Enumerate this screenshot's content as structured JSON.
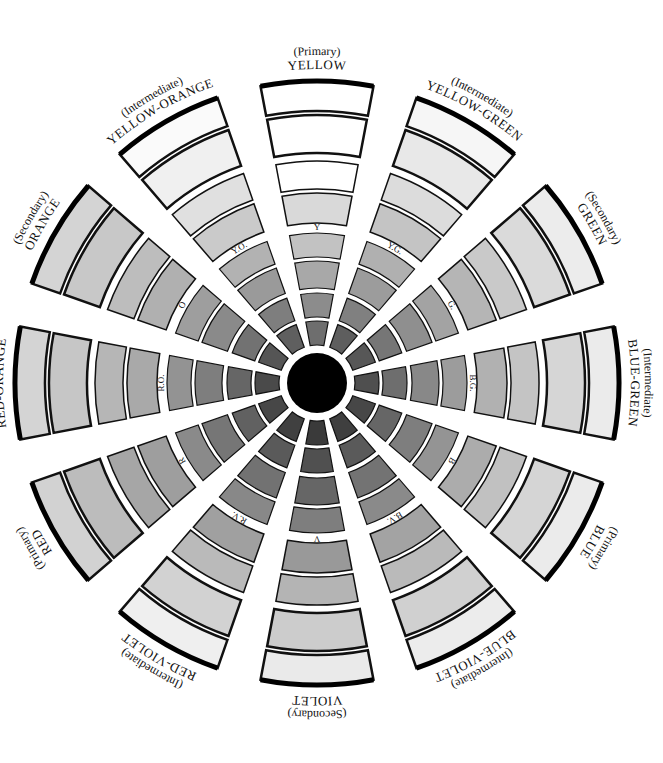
{
  "diagram": {
    "center": {
      "x": 317,
      "y": 383,
      "radius": 30,
      "color": "#000000"
    },
    "sector_span_deg": 22,
    "rings": [
      {
        "r1": 38,
        "r2": 62,
        "stroke": 1.2
      },
      {
        "r1": 66,
        "r2": 90,
        "stroke": 1.2
      },
      {
        "r1": 95,
        "r2": 122,
        "stroke": 1.2
      },
      {
        "r1": 126,
        "r2": 150,
        "stroke": 1.2
      },
      {
        "r1": 160,
        "r2": 190,
        "stroke": 1.5
      },
      {
        "r1": 194,
        "r2": 222,
        "stroke": 1.5
      },
      {
        "r1": 230,
        "r2": 268,
        "stroke": 2.5
      },
      {
        "r1": 272,
        "r2": 302,
        "stroke": 2.5,
        "outer_stroke": 5
      }
    ],
    "inner_label_radius": 155,
    "outer_label_radius": 312,
    "sectors": [
      {
        "id": "yellow",
        "angle": 0,
        "kind": "(Primary)",
        "name": "YELLOW",
        "abbr": "Y",
        "shades": [
          "#6e6e6e",
          "#8c8c8c",
          "#a8a8a8",
          "#c2c2c2",
          "#d9d9d9",
          "#ffffff",
          "#ffffff",
          "#ffffff"
        ]
      },
      {
        "id": "yellow-green",
        "angle": 30,
        "kind": "(Intermediate)",
        "name": "YELLOW-GREEN",
        "abbr": "Y.G.",
        "shades": [
          "#5e5e5e",
          "#808080",
          "#9c9c9c",
          "#b0b0b0",
          "#c4c4c4",
          "#dcdcdc",
          "#e8e8e8",
          "#f6f6f6"
        ]
      },
      {
        "id": "green",
        "angle": 60,
        "kind": "(Secondary)",
        "name": "GREEN",
        "abbr": "G.",
        "shades": [
          "#575757",
          "#767676",
          "#8f8f8f",
          "#a3a3a3",
          "#b5b5b5",
          "#c9c9c9",
          "#dadada",
          "#ececec"
        ]
      },
      {
        "id": "blue-green",
        "angle": 90,
        "kind": "(Intermediate)",
        "name": "BLUE-GREEN",
        "abbr": "B.G.",
        "shades": [
          "#4f4f4f",
          "#6e6e6e",
          "#888888",
          "#9c9c9c",
          "#b1b1b1",
          "#c4c4c4",
          "#d6d6d6",
          "#ebebeb"
        ]
      },
      {
        "id": "blue",
        "angle": 120,
        "kind": "(Primary)",
        "name": "BLUE",
        "abbr": "B",
        "shades": [
          "#474747",
          "#666666",
          "#7e7e7e",
          "#949494",
          "#acacac",
          "#c1c1c1",
          "#d5d5d5",
          "#ebebeb"
        ]
      },
      {
        "id": "blue-violet",
        "angle": 150,
        "kind": "(Intermediate)",
        "name": "BLUE-VIOLET",
        "abbr": "B.V.",
        "shades": [
          "#3f3f3f",
          "#5a5a5a",
          "#737373",
          "#8a8a8a",
          "#a3a3a3",
          "#bababa",
          "#d0d0d0",
          "#ececec"
        ]
      },
      {
        "id": "violet",
        "angle": 180,
        "kind": "(Secondary)",
        "name": "VIOLET",
        "abbr": "V",
        "shades": [
          "#3a3a3a",
          "#505050",
          "#666666",
          "#7e7e7e",
          "#999999",
          "#b4b4b4",
          "#cccccc",
          "#eaeaea"
        ]
      },
      {
        "id": "red-violet",
        "angle": 210,
        "kind": "(Intermediate)",
        "name": "RED-VIOLET",
        "abbr": "R.V.",
        "shades": [
          "#404040",
          "#5a5a5a",
          "#727272",
          "#888888",
          "#a0a0a0",
          "#bababa",
          "#d2d2d2",
          "#efefef"
        ]
      },
      {
        "id": "red",
        "angle": 240,
        "kind": "(Primary)",
        "name": "RED",
        "abbr": "R",
        "shades": [
          "#474747",
          "#616161",
          "#767676",
          "#8a8a8a",
          "#9e9e9e",
          "#a6a6a6",
          "#bcbcbc",
          "#d2d2d2"
        ]
      },
      {
        "id": "red-orange",
        "angle": 270,
        "kind": "(Intermediate)",
        "name": "RED-ORANGE",
        "abbr": "R.O.",
        "shades": [
          "#4a4a4a",
          "#666666",
          "#7e7e7e",
          "#939393",
          "#a9a9a9",
          "#b6b6b6",
          "#c6c6c6",
          "#d4d4d4"
        ]
      },
      {
        "id": "orange",
        "angle": 300,
        "kind": "(Secondary)",
        "name": "ORANGE",
        "abbr": "O",
        "shades": [
          "#555555",
          "#727272",
          "#8a8a8a",
          "#9e9e9e",
          "#b0b0b0",
          "#bdbdbd",
          "#c8c8c8",
          "#d4d4d4"
        ]
      },
      {
        "id": "yellow-orange",
        "angle": 330,
        "kind": "(Intermediate)",
        "name": "YELLOW-ORANGE",
        "abbr": "Y.O.",
        "shades": [
          "#5f5f5f",
          "#7e7e7e",
          "#9a9a9a",
          "#b2b2b2",
          "#cacaca",
          "#e0e0e0",
          "#f0f0f0",
          "#fafafa"
        ]
      }
    ]
  }
}
